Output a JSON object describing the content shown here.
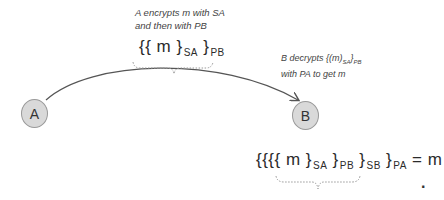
{
  "diagram": {
    "nodes": [
      {
        "id": "A",
        "label": "A",
        "fill": "#d9d9d9"
      },
      {
        "id": "B",
        "label": "B",
        "fill": "#d9d9d9"
      }
    ],
    "edge": {
      "from": "A",
      "to": "B",
      "style": "curved-arrow"
    },
    "top_note": {
      "line1": "A encrypts m with SA",
      "line2": "and then with PB"
    },
    "top_formula": {
      "open": "{{ m }",
      "sub1": "SA",
      "close": " }",
      "sub2": "PB"
    },
    "right_note": {
      "line1_prefix": "B decrypts {(m)",
      "line1_sub1": "SA",
      "line1_mid": "}",
      "line1_sub2": "PB",
      "line2": "with PA to get m"
    },
    "bottom_formula": {
      "open": "{{{{ m }",
      "sub1": "SA",
      "close2": " }",
      "sub2": "PB",
      "close3": " }",
      "sub3": "SB",
      "close4": " }",
      "sub4": "PA",
      "result": " = m"
    },
    "trailing_mark": "."
  }
}
